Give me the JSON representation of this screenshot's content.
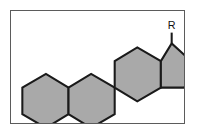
{
  "figure": {
    "frame": {
      "border_color": "#5b5b5b",
      "background_color": "#ffffff"
    },
    "style": {
      "ring_fill": "#a9a9a9",
      "bond_color": "#1a1a1a",
      "bond_width": 2.1
    },
    "labels": {
      "substituent": "R"
    },
    "rings": [
      {
        "id": "ring-a",
        "name": "A-ring",
        "type": "hexagon",
        "points": "11,78 11,105 35,119 58,105 58,78 35,64"
      },
      {
        "id": "ring-b",
        "name": "B-ring",
        "type": "hexagon",
        "points": "58,78 58,105 81,119 105,105 105,78 81,64"
      },
      {
        "id": "ring-c",
        "name": "C-ring",
        "type": "hexagon",
        "points": "105,78 105,51 128,37 152,51 152,78 128,92"
      },
      {
        "id": "ring-d",
        "name": "D-ring",
        "type": "pentagon",
        "points": "152,51 152,78 152,78 176,78 185,53 163,33"
      }
    ],
    "bonds": [
      {
        "id": "substituent-bond",
        "name": "r-substituent-bond",
        "x1": 163,
        "y1": 33,
        "x2": 163,
        "y2": 22
      }
    ],
    "substituent_label_position": {
      "x": 163,
      "y": 18
    }
  }
}
